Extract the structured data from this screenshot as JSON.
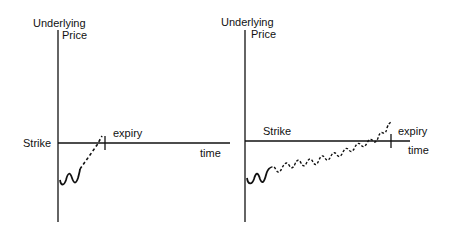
{
  "diagrams": [
    {
      "y_axis_label_line1": "Underlying",
      "y_axis_label_line2": "Price",
      "strike_label": "Strike",
      "expiry_label": "expiry",
      "x_axis_label": "time"
    },
    {
      "y_axis_label_line1": "Underlying",
      "y_axis_label_line2": "Price",
      "strike_label": "Strike",
      "expiry_label": "expiry",
      "x_axis_label": "time"
    }
  ],
  "colors": {
    "ink": "#111111",
    "background": "#ffffff"
  }
}
